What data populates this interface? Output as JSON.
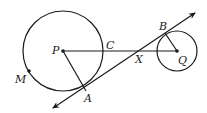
{
  "diagram": {
    "type": "geometry",
    "circles": [
      {
        "center_label": "P",
        "size": "large"
      },
      {
        "center_label": "Q",
        "size": "small"
      }
    ],
    "points": {
      "P": "P",
      "Q": "Q",
      "A": "A",
      "B": "B",
      "C": "C",
      "X": "X",
      "M": "M"
    },
    "segments": [
      "PQ",
      "PA",
      "QB"
    ],
    "lines": [
      {
        "through": [
          "A",
          "B"
        ],
        "arrows": "both"
      }
    ]
  }
}
